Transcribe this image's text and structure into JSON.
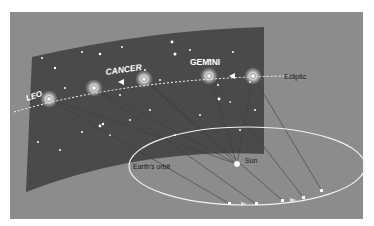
{
  "diagram": {
    "constellations": [
      {
        "name": "LEO"
      },
      {
        "name": "CANCER"
      },
      {
        "name": "GEMINI"
      }
    ],
    "labels": {
      "ecliptic": "Ecliptic",
      "earth_orbit": "Earth's orbit",
      "sun": "Sun"
    },
    "colors": {
      "background": "#8c8c8c",
      "sky_band": "#4a4a4a",
      "orbit": "#f2f2f2",
      "text_dark": "#1a1a1a",
      "text_light": "#ffffff"
    }
  }
}
